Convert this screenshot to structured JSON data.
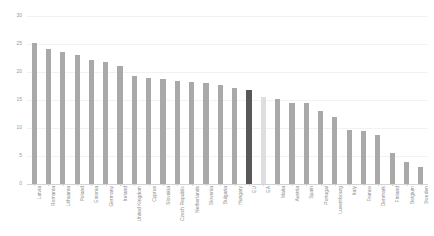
{
  "chart_data": {
    "type": "bar",
    "title": "",
    "subtitle": "",
    "xlabel": "",
    "ylabel": "",
    "ylim": [
      0,
      30
    ],
    "yticks": [
      0,
      5,
      10,
      15,
      20,
      25,
      30
    ],
    "ytick_labels": [
      "0",
      "5",
      "10",
      "15",
      "20",
      "25",
      "30"
    ],
    "grid": true,
    "legend": "none",
    "orientation": "vertical",
    "bar_color": "#a9a9a9",
    "highlight_colors": {
      "EU": "#585858",
      "EA": "#dedede"
    },
    "categories": [
      "Latvia",
      "Romania",
      "Lithuania",
      "Poland",
      "Estonia",
      "Germany",
      "Ireland",
      "United Kingdom",
      "Cyprus",
      "Slovakia",
      "Czech Republic",
      "Netherlands",
      "Slovenia",
      "Bulgaria",
      "Hungary",
      "EU",
      "EA",
      "Malta",
      "Austria",
      "Spain",
      "Portugal",
      "Luxembourg",
      "Italy",
      "France",
      "Denmark",
      "Finland",
      "Belgium",
      "Sweden"
    ],
    "values": [
      25.2,
      24.1,
      23.5,
      23.0,
      22.2,
      21.8,
      21.0,
      19.3,
      19.0,
      18.7,
      18.4,
      18.3,
      18.1,
      17.7,
      17.1,
      16.8,
      15.6,
      15.1,
      14.5,
      14.4,
      13.0,
      11.9,
      9.7,
      9.4,
      8.8,
      5.5,
      3.9,
      3.0
    ]
  }
}
